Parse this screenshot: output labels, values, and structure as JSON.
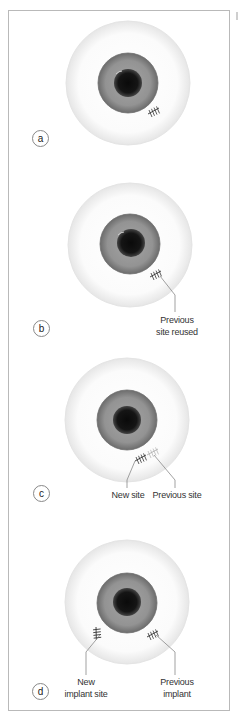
{
  "figure": {
    "type": "medical-illustration",
    "panels": [
      {
        "id": "a",
        "badge": "a",
        "labels": []
      },
      {
        "id": "b",
        "badge": "b",
        "labels": [
          {
            "line1": "Previous",
            "line2": "site reused"
          }
        ]
      },
      {
        "id": "c",
        "badge": "c",
        "labels": [
          {
            "line1": "New site"
          },
          {
            "line1": "Previous site"
          }
        ]
      },
      {
        "id": "d",
        "badge": "d",
        "labels": [
          {
            "line1": "New",
            "line2": "implant site"
          },
          {
            "line1": "Previous",
            "line2": "implant"
          }
        ]
      }
    ],
    "colors": {
      "frame_border": "#b9b9b9",
      "sclera_fill": "#ffffff",
      "sclera_edge": "#e2e2e2",
      "iris": "#8e8e8e",
      "iris_edge": "#6f6f6f",
      "pupil": "#111111",
      "suture": "#333333",
      "suture_faint": "#b0b0b0",
      "leader_line": "#7a7a7a"
    }
  }
}
